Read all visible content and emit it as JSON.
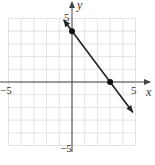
{
  "chart_data": {
    "type": "line",
    "title": "",
    "xlabel": "x",
    "ylabel": "y",
    "xlim": [
      -5,
      5
    ],
    "ylim": [
      -5,
      5
    ],
    "grid": true,
    "x_tick_labels": [
      "-5",
      "5"
    ],
    "y_tick_labels": [
      "5",
      "-5"
    ],
    "series": [
      {
        "name": "line",
        "equation": "y = -4/3 x + 4",
        "x": [
          -0.67,
          4.8
        ],
        "y": [
          4.9,
          -2.4
        ]
      }
    ],
    "points": [
      {
        "x": 0,
        "y": 4
      },
      {
        "x": 3,
        "y": 0
      }
    ]
  },
  "labels": {
    "x_axis": "x",
    "y_axis": "y",
    "x_min": "−5",
    "x_max": "5",
    "y_max": "5",
    "y_min": "−5"
  }
}
